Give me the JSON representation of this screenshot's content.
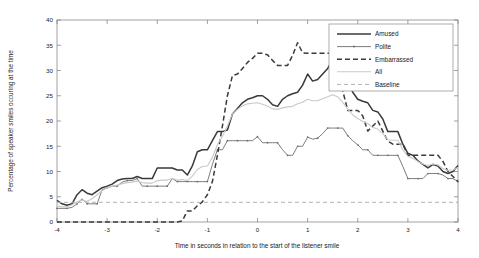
{
  "chart_data": {
    "type": "line",
    "title": "",
    "xlabel": "Time in seconds in relation to the start of the listener smile",
    "ylabel": "Percentage of speaker smiles occuring at the time",
    "xlim": [
      -4,
      4
    ],
    "ylim": [
      0,
      40
    ],
    "xticks": [
      -4,
      -3,
      -2,
      -1,
      0,
      1,
      2,
      3,
      4
    ],
    "xtick_labels": [
      "-4",
      "-3",
      "-2",
      "-1",
      "0",
      "1",
      "2",
      "3",
      "4"
    ],
    "yticks": [
      0,
      5,
      10,
      15,
      20,
      25,
      30,
      35,
      40
    ],
    "ytick_labels": [
      "0",
      "5",
      "10",
      "15",
      "20",
      "25",
      "30",
      "35",
      "40"
    ],
    "grid": false,
    "legend_position": "top-right",
    "x": [
      -4,
      -3.9,
      -3.8,
      -3.7,
      -3.6,
      -3.5,
      -3.4,
      -3.3,
      -3.2,
      -3.1,
      -3,
      -2.9,
      -2.8,
      -2.7,
      -2.6,
      -2.5,
      -2.4,
      -2.3,
      -2.2,
      -2.1,
      -2,
      -1.9,
      -1.8,
      -1.7,
      -1.6,
      -1.5,
      -1.4,
      -1.3,
      -1.2,
      -1.1,
      -1,
      -0.9,
      -0.8,
      -0.7,
      -0.6,
      -0.5,
      -0.4,
      -0.3,
      -0.2,
      -0.1,
      0,
      0.1,
      0.2,
      0.3,
      0.4,
      0.5,
      0.6,
      0.7,
      0.8,
      0.9,
      1,
      1.1,
      1.2,
      1.3,
      1.4,
      1.5,
      1.6,
      1.7,
      1.8,
      1.9,
      2,
      2.1,
      2.2,
      2.3,
      2.4,
      2.5,
      2.6,
      2.7,
      2.8,
      2.9,
      3,
      3.1,
      3.2,
      3.3,
      3.4,
      3.5,
      3.6,
      3.7,
      3.8,
      3.9,
      4
    ],
    "series": [
      {
        "name": "Amused",
        "style": "solid",
        "color": "#3a3a3a",
        "values": [
          4.3,
          3.6,
          3.3,
          3.6,
          5.4,
          6.4,
          5.7,
          5.4,
          6.1,
          6.8,
          7.1,
          7.5,
          8.2,
          8.5,
          8.6,
          8.6,
          9.0,
          8.6,
          8.6,
          8.6,
          10.7,
          10.7,
          10.7,
          10.7,
          10.3,
          10.3,
          9.3,
          11.1,
          13.9,
          14.3,
          14.3,
          16.1,
          17.9,
          17.9,
          18.2,
          21.4,
          22.5,
          23.6,
          24.3,
          24.6,
          25.0,
          25.0,
          24.3,
          23.2,
          22.9,
          24.3,
          25.0,
          25.4,
          25.7,
          27.1,
          29.3,
          27.9,
          28.2,
          29.3,
          30.4,
          32.1,
          31.8,
          30.0,
          27.9,
          25.7,
          24.3,
          23.9,
          23.6,
          22.1,
          21.8,
          20.4,
          17.9,
          17.9,
          17.9,
          15.4,
          13.6,
          13.2,
          12.1,
          11.4,
          10.7,
          11.4,
          11.1,
          10.0,
          9.6,
          10.0,
          11.2
        ]
      },
      {
        "name": "Polite",
        "style": "solid-marker",
        "color": "#6e6e6e",
        "values": [
          2.7,
          2.7,
          2.7,
          2.9,
          3.6,
          4.6,
          3.6,
          3.6,
          3.6,
          6.4,
          6.8,
          7.1,
          7.1,
          7.9,
          8.2,
          8.2,
          8.6,
          7.1,
          7.1,
          7.1,
          7.1,
          7.1,
          7.1,
          8.6,
          8.0,
          8.0,
          8.0,
          8.0,
          8.0,
          8.0,
          8.0,
          11.4,
          14.3,
          14.3,
          16.1,
          16.1,
          16.1,
          16.1,
          16.1,
          16.1,
          16.9,
          15.7,
          15.7,
          15.7,
          15.7,
          14.3,
          13.2,
          13.2,
          15.0,
          15.0,
          16.8,
          16.4,
          16.6,
          17.5,
          18.6,
          18.6,
          18.6,
          18.6,
          17.1,
          16.1,
          15.3,
          14.3,
          14.3,
          13.2,
          13.2,
          13.2,
          13.2,
          13.2,
          13.2,
          11.0,
          8.6,
          8.6,
          8.6,
          8.6,
          9.6,
          9.6,
          9.6,
          9.3,
          8.6,
          8.6,
          8.0
        ]
      },
      {
        "name": "Embarrassed",
        "style": "dashed",
        "color": "#3a3a3a",
        "values": [
          0,
          0,
          0,
          0,
          0,
          0,
          0,
          0,
          0,
          0,
          0,
          0,
          0,
          0,
          0,
          0,
          0,
          0,
          0,
          0,
          0,
          0,
          0,
          0,
          0,
          0.2,
          2.2,
          2.2,
          3.2,
          4.0,
          5.4,
          8.0,
          13.2,
          19.0,
          25.0,
          29.0,
          29.3,
          30.4,
          31.6,
          32.4,
          33.4,
          33.4,
          33.1,
          32.0,
          31.0,
          31.0,
          31.0,
          33.0,
          35.5,
          33.5,
          33.4,
          33.4,
          33.4,
          33.4,
          33.4,
          33.4,
          31.0,
          26.0,
          22.1,
          22.1,
          22.1,
          21.0,
          18.0,
          19.0,
          20.0,
          18.0,
          16.0,
          15.4,
          15.4,
          15.4,
          13.2,
          13.2,
          13.2,
          13.2,
          13.2,
          13.2,
          13.2,
          12.0,
          10.0,
          9.0,
          8.0
        ]
      },
      {
        "name": "All",
        "style": "thin-light",
        "color": "#c9c9c9",
        "values": [
          3.2,
          3.0,
          3.0,
          3.4,
          4.0,
          4.3,
          4.1,
          4.6,
          5.4,
          6.2,
          6.8,
          7.1,
          7.3,
          7.6,
          7.8,
          7.9,
          8.1,
          7.8,
          7.7,
          7.7,
          8.2,
          8.3,
          8.3,
          8.6,
          8.3,
          8.4,
          8.2,
          9.1,
          10.4,
          11.0,
          11.1,
          12.8,
          15.3,
          17.0,
          19.0,
          21.4,
          22.3,
          23.0,
          23.4,
          23.5,
          23.6,
          23.3,
          22.9,
          22.4,
          22.3,
          22.6,
          22.8,
          22.9,
          23.4,
          23.7,
          24.3,
          24.0,
          24.0,
          24.4,
          24.8,
          25.2,
          24.8,
          23.7,
          22.4,
          21.2,
          20.5,
          19.9,
          19.5,
          18.7,
          18.4,
          17.5,
          16.3,
          16.2,
          16.2,
          14.3,
          13.0,
          12.6,
          12.0,
          11.5,
          11.2,
          11.5,
          11.3,
          10.6,
          10.2,
          10.3,
          10.8
        ]
      },
      {
        "name": "Baseline",
        "style": "dashed-light",
        "color": "#b0b0b0",
        "values": [
          3.9,
          3.9,
          3.9,
          3.9,
          3.9,
          3.9,
          3.9,
          3.9,
          3.9,
          3.9,
          3.9,
          3.9,
          3.9,
          3.9,
          3.9,
          3.9,
          3.9,
          3.9,
          3.9,
          3.9,
          3.9,
          3.9,
          3.9,
          3.9,
          3.9,
          3.9,
          3.9,
          3.9,
          3.9,
          3.9,
          3.9,
          3.9,
          3.9,
          3.9,
          3.9,
          3.9,
          3.9,
          3.9,
          3.9,
          3.9,
          3.9,
          3.9,
          3.9,
          3.9,
          3.9,
          3.9,
          3.9,
          3.9,
          3.9,
          3.9,
          3.9,
          3.9,
          3.9,
          3.9,
          3.9,
          3.9,
          3.9,
          3.9,
          3.9,
          3.9,
          3.9,
          3.9,
          3.9,
          3.9,
          3.9,
          3.9,
          3.9,
          3.9,
          3.9,
          3.9,
          3.9,
          3.9,
          3.9,
          3.9,
          3.9,
          3.9,
          3.9,
          3.9,
          3.9,
          3.9,
          3.9
        ]
      }
    ],
    "legend": [
      "Amused",
      "Polite",
      "Embarrassed",
      "All",
      "Baseline"
    ]
  },
  "figure": {
    "background_color": "#ffffff",
    "axis_color": "#6b6b6b"
  }
}
